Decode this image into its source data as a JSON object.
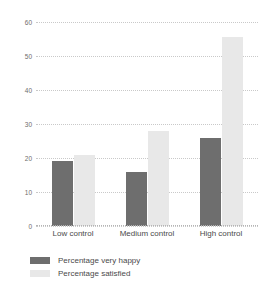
{
  "chart_data": {
    "type": "bar",
    "title": "",
    "subtitle": "",
    "xlabel": "",
    "ylabel": "",
    "categories": [
      "Low control",
      "Medium control",
      "High control"
    ],
    "series": [
      {
        "name": "Percentage very happy",
        "color": "#6e6e6e",
        "values": [
          19,
          16,
          26
        ]
      },
      {
        "name": "Percentage satisfied",
        "color": "#e8e8e8",
        "values": [
          21,
          28,
          55.5
        ]
      }
    ],
    "ylim": [
      0,
      60
    ],
    "yticks": [
      0,
      10,
      20,
      30,
      40,
      50,
      60
    ],
    "ytick_labels": [
      "0",
      "10",
      "20",
      "30",
      "40",
      "50",
      "60"
    ],
    "grid": true,
    "grid_style": "dotted-horizontal",
    "legend_position": "bottom-left",
    "background_color": "#ffffff",
    "axis_label_color": "#4a4a4a"
  }
}
